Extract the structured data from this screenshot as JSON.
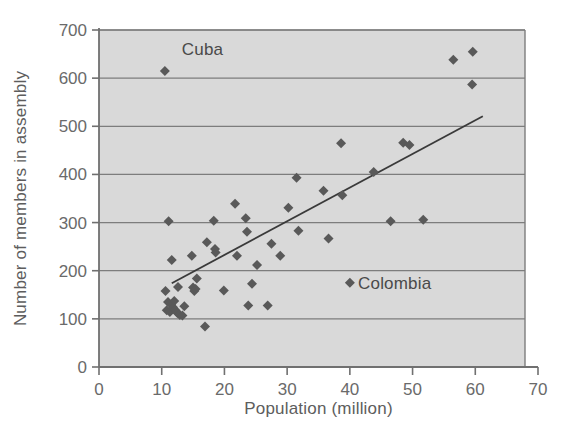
{
  "chart_data": {
    "type": "scatter",
    "title": "",
    "xlabel": "Population (million)",
    "ylabel": "Number of members in assembly",
    "xlim": [
      0,
      70
    ],
    "ylim": [
      0,
      700
    ],
    "xticks": [
      0,
      10,
      20,
      30,
      40,
      50,
      60,
      70
    ],
    "yticks": [
      0,
      100,
      200,
      300,
      400,
      500,
      600,
      700
    ],
    "grid": "horizontal",
    "legend": "none",
    "plot_background": "#d9d9d9",
    "marker_color": "#595959",
    "marker_shape": "diamond",
    "line_color": "#3a3a3a",
    "axis_color": "#808080",
    "points": [
      {
        "x": 10.5,
        "y": 615,
        "label": "Cuba"
      },
      {
        "x": 11.1,
        "y": 303,
        "label": ""
      },
      {
        "x": 11.6,
        "y": 222,
        "label": ""
      },
      {
        "x": 10.6,
        "y": 158,
        "label": ""
      },
      {
        "x": 11.0,
        "y": 135,
        "label": ""
      },
      {
        "x": 10.8,
        "y": 118,
        "label": ""
      },
      {
        "x": 11.3,
        "y": 114,
        "label": ""
      },
      {
        "x": 11.5,
        "y": 130,
        "label": ""
      },
      {
        "x": 11.8,
        "y": 124,
        "label": ""
      },
      {
        "x": 12.0,
        "y": 137,
        "label": ""
      },
      {
        "x": 12.2,
        "y": 118,
        "label": ""
      },
      {
        "x": 12.5,
        "y": 112,
        "label": ""
      },
      {
        "x": 12.9,
        "y": 108,
        "label": ""
      },
      {
        "x": 13.3,
        "y": 107,
        "label": ""
      },
      {
        "x": 12.6,
        "y": 166,
        "label": ""
      },
      {
        "x": 13.6,
        "y": 126,
        "label": ""
      },
      {
        "x": 14.8,
        "y": 231,
        "label": ""
      },
      {
        "x": 15.0,
        "y": 165,
        "label": ""
      },
      {
        "x": 15.2,
        "y": 158,
        "label": ""
      },
      {
        "x": 15.4,
        "y": 162,
        "label": ""
      },
      {
        "x": 15.6,
        "y": 184,
        "label": ""
      },
      {
        "x": 16.9,
        "y": 84,
        "label": ""
      },
      {
        "x": 17.2,
        "y": 259,
        "label": ""
      },
      {
        "x": 18.3,
        "y": 304,
        "label": ""
      },
      {
        "x": 18.5,
        "y": 245,
        "label": ""
      },
      {
        "x": 18.6,
        "y": 238,
        "label": ""
      },
      {
        "x": 19.9,
        "y": 159,
        "label": ""
      },
      {
        "x": 21.7,
        "y": 339,
        "label": ""
      },
      {
        "x": 22.0,
        "y": 231,
        "label": ""
      },
      {
        "x": 23.4,
        "y": 309,
        "label": ""
      },
      {
        "x": 23.6,
        "y": 281,
        "label": ""
      },
      {
        "x": 23.8,
        "y": 128,
        "label": ""
      },
      {
        "x": 24.4,
        "y": 173,
        "label": ""
      },
      {
        "x": 25.2,
        "y": 212,
        "label": ""
      },
      {
        "x": 26.9,
        "y": 128,
        "label": ""
      },
      {
        "x": 27.5,
        "y": 256,
        "label": ""
      },
      {
        "x": 28.9,
        "y": 231,
        "label": ""
      },
      {
        "x": 30.2,
        "y": 331,
        "label": ""
      },
      {
        "x": 31.5,
        "y": 393,
        "label": ""
      },
      {
        "x": 31.8,
        "y": 283,
        "label": ""
      },
      {
        "x": 35.8,
        "y": 366,
        "label": ""
      },
      {
        "x": 36.6,
        "y": 267,
        "label": ""
      },
      {
        "x": 38.6,
        "y": 465,
        "label": ""
      },
      {
        "x": 38.8,
        "y": 357,
        "label": ""
      },
      {
        "x": 40.0,
        "y": 175,
        "label": "Colombia"
      },
      {
        "x": 43.8,
        "y": 405,
        "label": ""
      },
      {
        "x": 46.5,
        "y": 303,
        "label": ""
      },
      {
        "x": 48.5,
        "y": 466,
        "label": ""
      },
      {
        "x": 49.5,
        "y": 461,
        "label": ""
      },
      {
        "x": 51.7,
        "y": 306,
        "label": ""
      },
      {
        "x": 56.5,
        "y": 638,
        "label": ""
      },
      {
        "x": 59.6,
        "y": 655,
        "label": ""
      },
      {
        "x": 59.5,
        "y": 587,
        "label": ""
      }
    ],
    "trendline": {
      "x1": 11.6,
      "y1": 174,
      "x2": 61.2,
      "y2": 521
    }
  },
  "annotations": [
    {
      "name": "cuba-label",
      "text": "Cuba",
      "x": 13.2,
      "y": 648
    },
    {
      "name": "colombia-label",
      "text": "Colombia",
      "x": 41.3,
      "y": 163
    }
  ]
}
